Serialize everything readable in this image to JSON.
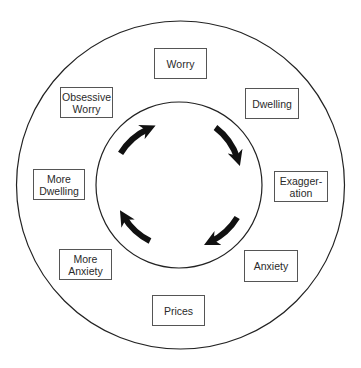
{
  "diagram": {
    "type": "cycle",
    "colors": {
      "stroke": "#222222",
      "box_border": "#555555",
      "text": "#2a2a2a",
      "arrow_fill": "#111111",
      "background": "#ffffff"
    },
    "outer_circle": {
      "cx": 180.5,
      "cy": 185,
      "r": 164
    },
    "inner_circle": {
      "cx": 179,
      "cy": 185,
      "r": 83
    },
    "arrow_direction": "clockwise",
    "arrow_count": 4,
    "nodes": [
      {
        "id": "worry",
        "label": "Worry",
        "x": 154,
        "y": 48,
        "w": 53,
        "h": 31
      },
      {
        "id": "dwelling",
        "label": "Dwelling",
        "x": 245,
        "y": 88,
        "w": 54,
        "h": 31
      },
      {
        "id": "exaggeration",
        "label": "Exagger-\nation",
        "x": 274,
        "y": 171,
        "w": 54,
        "h": 31
      },
      {
        "id": "anxiety",
        "label": "Anxiety",
        "x": 244,
        "y": 250,
        "w": 54,
        "h": 32
      },
      {
        "id": "prices",
        "label": "Prices",
        "x": 152,
        "y": 295,
        "w": 53,
        "h": 31
      },
      {
        "id": "more-anxiety",
        "label": "More\nAnxiety",
        "x": 59,
        "y": 249,
        "w": 53,
        "h": 31
      },
      {
        "id": "more-dwelling",
        "label": "More\nDwelling",
        "x": 33,
        "y": 169,
        "w": 52,
        "h": 31
      },
      {
        "id": "obsessive-worry",
        "label": "Obsessive\nWorry",
        "x": 60,
        "y": 87,
        "w": 53,
        "h": 31
      }
    ]
  }
}
